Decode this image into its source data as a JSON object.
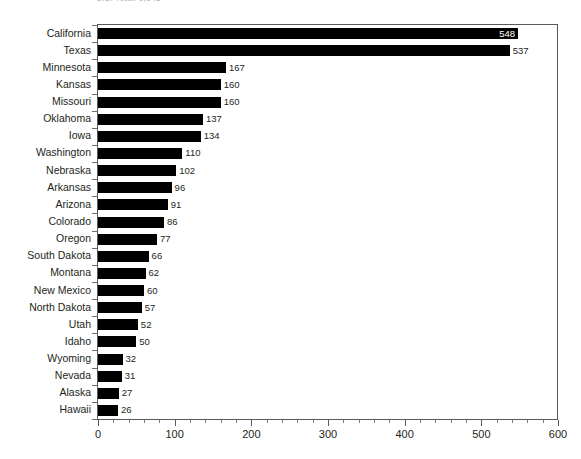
{
  "chart_data": {
    "type": "bar",
    "orientation": "horizontal",
    "title": "U.S. Total: 3,341",
    "title_cropped": true,
    "xlabel": "",
    "ylabel": "",
    "xlim": [
      0,
      600
    ],
    "xticks": [
      0,
      100,
      200,
      300,
      400,
      500,
      600
    ],
    "xtick_labels": [
      "0",
      "100",
      "200",
      "300",
      "400",
      "500",
      "600"
    ],
    "minor_tick_interval": 20,
    "grid": false,
    "legend": false,
    "bar_color": "#000000",
    "categories": [
      "California",
      "Texas",
      "Minnesota",
      "Kansas",
      "Missouri",
      "Oklahoma",
      "Iowa",
      "Washington",
      "Nebraska",
      "Arkansas",
      "Arizona",
      "Colorado",
      "Oregon",
      "South Dakota",
      "Montana",
      "New Mexico",
      "North Dakota",
      "Utah",
      "Idaho",
      "Wyoming",
      "Nevada",
      "Alaska",
      "Hawaii"
    ],
    "values": [
      548,
      537,
      167,
      160,
      160,
      137,
      134,
      110,
      102,
      96,
      91,
      86,
      77,
      66,
      62,
      60,
      57,
      52,
      50,
      32,
      31,
      27,
      26
    ],
    "value_labels": [
      "548",
      "537",
      "167",
      "160",
      "160",
      "137",
      "134",
      "110",
      "102",
      "96",
      "91",
      "86",
      "77",
      "66",
      "62",
      "60",
      "57",
      "52",
      "50",
      "32",
      "31",
      "27",
      "26"
    ]
  }
}
